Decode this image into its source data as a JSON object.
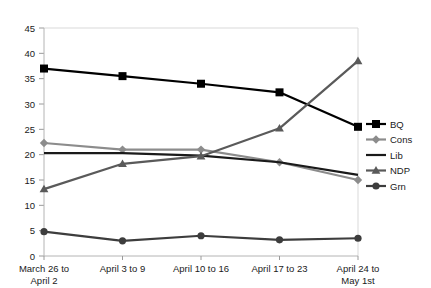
{
  "chart_data": {
    "type": "line",
    "title": "",
    "subtitle": "",
    "xlabel": "",
    "ylabel": "",
    "grid": false,
    "legend_position": "right",
    "ylim": [
      0,
      45
    ],
    "yticks": [
      "0",
      "5",
      "10",
      "15",
      "20",
      "25",
      "30",
      "35",
      "40",
      "45"
    ],
    "categories": [
      "March 26 to April 2",
      "April 3 to 9",
      "April 10 to 16",
      "April 17 to 23",
      "April 24 to May 1st"
    ],
    "category_lines": [
      [
        "March 26 to",
        "April 2"
      ],
      [
        "April 3 to 9",
        ""
      ],
      [
        "April 10 to 16",
        ""
      ],
      [
        "April 17 to 23",
        ""
      ],
      [
        "April 24 to",
        "May 1st"
      ]
    ],
    "series": [
      {
        "name": "BQ",
        "values": [
          37.0,
          35.5,
          34.0,
          32.3,
          25.5
        ],
        "color": "#000000",
        "marker": "square"
      },
      {
        "name": "Cons",
        "values": [
          22.3,
          21.0,
          21.0,
          18.5,
          15.0
        ],
        "color": "#8c8c8c",
        "marker": "diamond"
      },
      {
        "name": "Lib",
        "values": [
          20.3,
          20.3,
          19.8,
          18.5,
          16.0
        ],
        "color": "#1a1a1a",
        "marker": "none"
      },
      {
        "name": "NDP",
        "values": [
          13.2,
          18.2,
          19.7,
          25.2,
          38.5
        ],
        "color": "#5a5a5a",
        "marker": "triangle"
      },
      {
        "name": "Grn",
        "values": [
          4.8,
          3.0,
          4.0,
          3.2,
          3.5
        ],
        "color": "#3d3d3d",
        "marker": "circle"
      }
    ]
  },
  "legend": {
    "items": [
      {
        "label": "BQ"
      },
      {
        "label": "Cons"
      },
      {
        "label": "Lib"
      },
      {
        "label": "NDP"
      },
      {
        "label": "Grn"
      }
    ]
  }
}
